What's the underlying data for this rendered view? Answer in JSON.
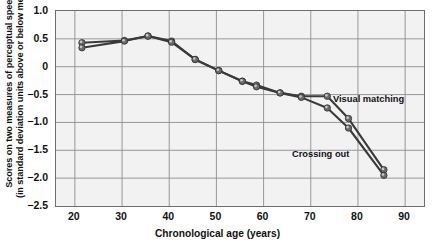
{
  "chart_data": {
    "type": "line",
    "title": "",
    "xlabel": "Chronological age (years)",
    "ylabel": "Scores on two measures of perceptual speed (in standard deviation units above or below mean)",
    "ylabel_line1": "Scores on two measures of perceptual speed",
    "ylabel_line2": "(in standard deviation units above or below mean)",
    "xlim": [
      16,
      94
    ],
    "ylim": [
      -2.5,
      1.0
    ],
    "xticks": [
      20,
      30,
      40,
      50,
      60,
      70,
      80,
      90
    ],
    "yticks": [
      1.0,
      0.5,
      0,
      -0.5,
      -1.0,
      -1.5,
      -2.0,
      -2.5
    ],
    "ytick_labels": [
      "1.0",
      "0.5",
      "0",
      "-0.5",
      "-1.0",
      "-1.5",
      "-2.0",
      "-2.5"
    ],
    "xtick_labels": [
      "20",
      "30",
      "40",
      "50",
      "60",
      "70",
      "80",
      "90"
    ],
    "grid": true,
    "legend_position": "inline-annotation",
    "series": [
      {
        "name": "Visual matching",
        "color": "#3a3a3a",
        "x": [
          21.5,
          30.5,
          35.5,
          40.5,
          45.5,
          50.5,
          55.5,
          58.5,
          63.5,
          68.0,
          73.5,
          78.0,
          85.5
        ],
        "y": [
          0.43,
          0.47,
          0.55,
          0.46,
          0.13,
          -0.07,
          -0.26,
          -0.33,
          -0.47,
          -0.53,
          -0.53,
          -0.93,
          -1.85
        ]
      },
      {
        "name": "Crossing out",
        "color": "#3a3a3a",
        "x": [
          21.5,
          30.5,
          35.5,
          40.5,
          45.5,
          50.5,
          55.5,
          58.5,
          63.5,
          68.0,
          73.5,
          78.0,
          85.5
        ],
        "y": [
          0.34,
          0.46,
          0.55,
          0.44,
          0.13,
          -0.07,
          -0.26,
          -0.36,
          -0.47,
          -0.55,
          -0.74,
          -1.1,
          -1.95
        ]
      }
    ],
    "annotations": [
      {
        "label": "Visual matching",
        "series": "Visual matching"
      },
      {
        "label": "Crossing out",
        "series": "Crossing out"
      }
    ],
    "colors": {
      "plot_background": "#f2f2f2",
      "grid": "#8d8d8d",
      "frame": "#6e6e6e",
      "line": "#3a3a3a",
      "marker": "#9a9a9a",
      "text": "#111111"
    }
  }
}
